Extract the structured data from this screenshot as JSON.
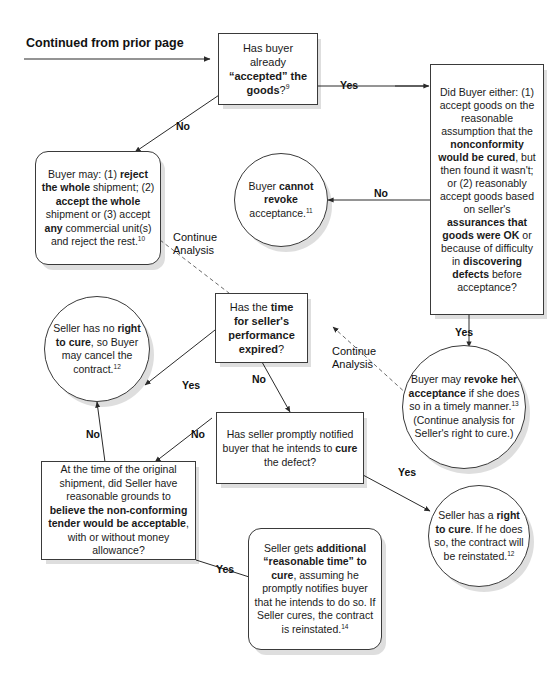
{
  "page": {
    "width": 555,
    "height": 683,
    "background": "#ffffff",
    "ink": "#1a1a1a",
    "shadow": "rgba(0,0,0,0.13)"
  },
  "header": {
    "continued_label": "Continued from prior page"
  },
  "nodes": {
    "has_accepted": {
      "shape": "rect",
      "text_html": "Has buyer already <b>“accepted” the goods</b>?<sup>9</sup>"
    },
    "did_buyer_either": {
      "shape": "rect",
      "text_html": "Did Buyer either: (1) accept goods on the reasonable assumption that the <b>nonconformity would be cured</b>, but then found it wasn't; or (2) reasonably accept goods based on seller's <b>assurances that goods were OK</b> or because of difficulty in <b>discovering defects</b> before acceptance?"
    },
    "buyer_may_reject": {
      "shape": "round",
      "text_html": "Buyer may: (1) <b>reject the whole</b> shipment; (2) <b>accept the whole</b> shipment or (3) accept <b>any</b> commercial unit(s) and reject the rest.<sup>10</sup>"
    },
    "cannot_revoke": {
      "shape": "circle",
      "text_html": "Buyer <b>cannot revoke</b> acceptance.<sup>11</sup>"
    },
    "time_expired": {
      "shape": "rect",
      "text_html": "Has the <b>time for seller's performance expired</b>?"
    },
    "no_right_to_cure": {
      "shape": "circle",
      "text_html": "Seller has no <b>right to cure</b>, so Buyer may cancel the contract.<sup>12</sup>"
    },
    "may_revoke": {
      "shape": "circle",
      "text_html": "Buyer may <b>revoke her acceptance</b> if she does so in a timely manner.<sup>13</sup> (Continue analysis for Seller's right to cure.)"
    },
    "promptly_notified": {
      "shape": "rect",
      "text_html": "Has seller promptly notified buyer that he intends to <b>cure</b> the defect?"
    },
    "reasonable_grounds": {
      "shape": "rect",
      "text_html": "At the time of the original shipment, did Seller have reasonable grounds to <b>believe the non-conforming tender would be acceptable</b>, with or without money allowance?"
    },
    "additional_time": {
      "shape": "round",
      "text_html": "Seller gets <b>additional “reasonable time” to cure</b>, assuming he promptly notifies buyer that he intends to do so. If Seller cures, the contract is reinstated.<sup>14</sup>"
    },
    "right_to_cure": {
      "shape": "circle",
      "text_html": "Seller has a <b>right to cure</b>. If he does so, the contract will be reinstated.<sup>12</sup>"
    }
  },
  "edge_labels": {
    "accepted_yes": "Yes",
    "accepted_no": "No",
    "did_buyer_no": "No",
    "did_buyer_yes": "Yes",
    "continue_analysis_left": "Continue\nAnalysis",
    "continue_analysis_right": "Continue\nAnalysis",
    "time_expired_yes": "Yes",
    "time_expired_no": "No",
    "notified_no": "No",
    "notified_yes": "Yes",
    "grounds_no": "No",
    "grounds_yes": "Yes"
  }
}
